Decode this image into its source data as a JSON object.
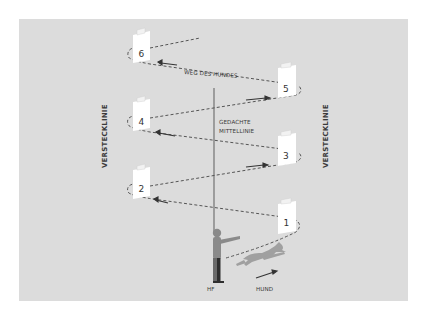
{
  "diagram": {
    "type": "search-pattern",
    "labels": {
      "dog_path": "WEG DES HUNDES",
      "center_line_1": "GEDACHTE",
      "center_line_2": "MITTELLINIE",
      "hide_line_left": "VERSTECKLINIE",
      "hide_line_right": "VERSTECKLINIE",
      "handler": "HF",
      "dog": "HUND"
    },
    "hides": [
      {
        "number": "1",
        "side": "right"
      },
      {
        "number": "2",
        "side": "left"
      },
      {
        "number": "3",
        "side": "right"
      },
      {
        "number": "4",
        "side": "left"
      },
      {
        "number": "5",
        "side": "right"
      },
      {
        "number": "6",
        "side": "left"
      }
    ],
    "colors": {
      "background": "#dcdcdc",
      "path": "#555555",
      "center_line": "#777777",
      "figure": "#8a8a8a",
      "card": "#ffffff"
    }
  }
}
